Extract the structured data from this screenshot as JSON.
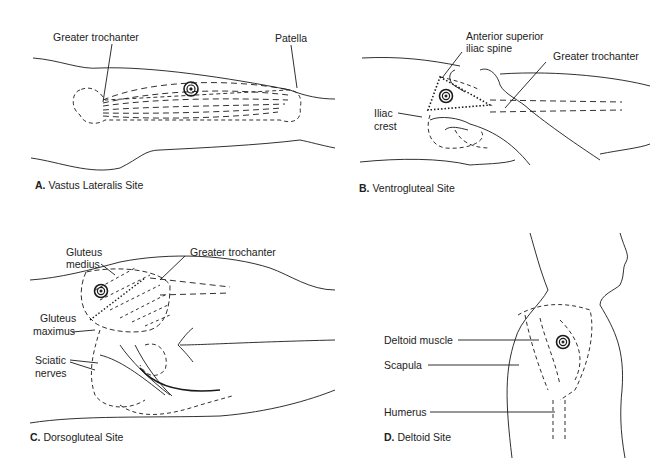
{
  "figure": {
    "panels": [
      {
        "id": "A",
        "caption_letter": "A.",
        "caption_text": "Vastus Lateralis Site",
        "labels": [
          "Greater trochanter",
          "Patella"
        ]
      },
      {
        "id": "B",
        "caption_letter": "B.",
        "caption_text": "Ventrogluteal Site",
        "labels": [
          "Anterior superior",
          "iliac spine",
          "Greater trochanter",
          "Iliac",
          "crest"
        ]
      },
      {
        "id": "C",
        "caption_letter": "C.",
        "caption_text": "Dorsogluteal Site",
        "labels": [
          "Gluteus",
          "medius",
          "Greater trochanter",
          "Gluteus",
          "maximus",
          "Sciatic",
          "nerves"
        ]
      },
      {
        "id": "D",
        "caption_letter": "D.",
        "caption_text": "Deltoid Site",
        "labels": [
          "Deltoid muscle",
          "Scapula",
          "Humerus"
        ]
      }
    ],
    "colors": {
      "line": "#1a1a1a",
      "background": "#ffffff"
    }
  }
}
